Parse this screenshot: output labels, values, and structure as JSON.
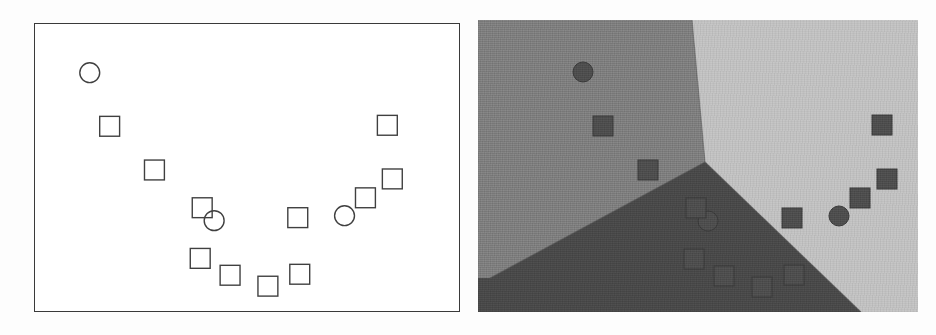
{
  "figure": {
    "title": "",
    "background_color": "#fdfdfd",
    "width": 936,
    "height": 335
  },
  "panels": [
    {
      "id": "left-panel",
      "name": "training-data-panel",
      "caption": "",
      "background_color": "#ffffff",
      "border_color": "#3a3a3a",
      "x": 34,
      "y": 23,
      "width": 426,
      "height": 289
    },
    {
      "id": "right-panel",
      "name": "decision-regions-panel",
      "caption": "",
      "background_color": "#808080",
      "x": 478,
      "y": 20,
      "width": 440,
      "height": 292
    }
  ],
  "chart_data": {
    "type": "scatter",
    "title": "",
    "subtitle": "",
    "xlabel": "",
    "ylabel": "",
    "xlim": [
      0,
      426
    ],
    "ylim": [
      0,
      289
    ],
    "grid": false,
    "legend": {
      "visible": false,
      "position": "none",
      "entries": [
        {
          "label": "circle-class",
          "marker": "circle"
        },
        {
          "label": "square-class",
          "marker": "square"
        }
      ]
    },
    "marker_styles": {
      "left_panel": {
        "fill": "none",
        "stroke": "#404040",
        "stroke_width": 1.4,
        "square_size": 20,
        "circle_radius": 10
      },
      "right_panel": {
        "fill": "#4f4f4f",
        "stroke": "#3b3b3b",
        "stroke_width": 1.0,
        "square_size": 20,
        "circle_radius": 10
      }
    },
    "series": [
      {
        "name": "circles",
        "marker": "circle",
        "points": [
          {
            "x": 55,
            "y": 49
          },
          {
            "x": 180,
            "y": 198
          },
          {
            "x": 311,
            "y": 193
          }
        ]
      },
      {
        "name": "squares",
        "marker": "square",
        "points": [
          {
            "x": 75,
            "y": 103
          },
          {
            "x": 120,
            "y": 147
          },
          {
            "x": 168,
            "y": 185
          },
          {
            "x": 166,
            "y": 236
          },
          {
            "x": 196,
            "y": 253
          },
          {
            "x": 234,
            "y": 264
          },
          {
            "x": 266,
            "y": 252
          },
          {
            "x": 264,
            "y": 195
          },
          {
            "x": 332,
            "y": 175
          },
          {
            "x": 359,
            "y": 156
          },
          {
            "x": 354,
            "y": 102
          }
        ]
      }
    ],
    "decision_regions": {
      "description": "three-region piecewise-linear decision boundary meeting at a triple point",
      "triple_point": {
        "x": 227,
        "y": 142
      },
      "regions": [
        {
          "name": "region-upper-left",
          "color": "#808080",
          "polygon": [
            [
              0,
              0
            ],
            [
              214,
              0
            ],
            [
              227,
              142
            ],
            [
              12,
              258
            ],
            [
              0,
              258
            ]
          ]
        },
        {
          "name": "region-upper-right",
          "color": "#c3c3c3",
          "polygon": [
            [
              214,
              0
            ],
            [
              440,
              0
            ],
            [
              440,
              292
            ],
            [
              383,
              292
            ],
            [
              227,
              142
            ]
          ]
        },
        {
          "name": "region-lower",
          "color": "#4a4a4a",
          "polygon": [
            [
              227,
              142
            ],
            [
              383,
              292
            ],
            [
              0,
              292
            ],
            [
              0,
              258
            ],
            [
              12,
              258
            ]
          ]
        }
      ],
      "boundary_color": "#5a5a5a"
    }
  },
  "annotations": {
    "left_panel_label": "",
    "right_panel_label": ""
  }
}
